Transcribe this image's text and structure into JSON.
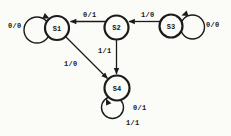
{
  "diagram": {
    "type": "state-machine",
    "states": [
      {
        "id": "S1",
        "label": "S1"
      },
      {
        "id": "S2",
        "label": "S2"
      },
      {
        "id": "S3",
        "label": "S3"
      },
      {
        "id": "S4",
        "label": "S4"
      }
    ],
    "transitions": [
      {
        "from": "S1",
        "to": "S1",
        "label": "0/0"
      },
      {
        "from": "S2",
        "to": "S1",
        "label": "0/1"
      },
      {
        "from": "S3",
        "to": "S2",
        "label": "1/0"
      },
      {
        "from": "S3",
        "to": "S3",
        "label": "0/0"
      },
      {
        "from": "S2",
        "to": "S4",
        "label": "1/1"
      },
      {
        "from": "S1",
        "to": "S4",
        "label": "1/0"
      },
      {
        "from": "S4",
        "to": "S4",
        "label": "0/1"
      },
      {
        "from": "S4",
        "to": "S4",
        "label": "1/1"
      }
    ],
    "colors": {
      "stroke": "#1b1b1b",
      "background": "#fbfbf8"
    }
  }
}
